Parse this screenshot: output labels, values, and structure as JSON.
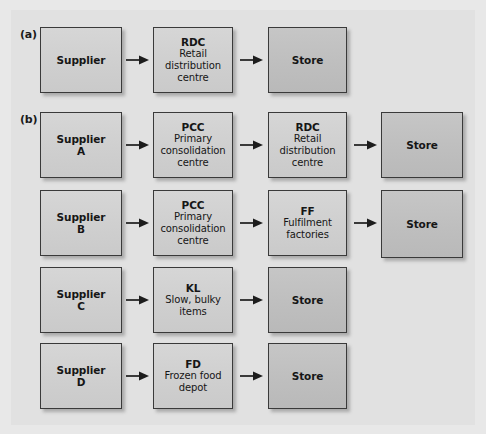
{
  "figure": {
    "background_color": "#e1e1e1",
    "frame_color": "#e8e8e8",
    "box_light_color": "#d2d2d2",
    "box_dark_color": "#c2c2c2",
    "border_color": "#3a3a3a",
    "text_color": "#161616"
  },
  "sections": {
    "a": {
      "label": "(a)"
    },
    "b": {
      "label": "(b)"
    }
  },
  "nodes": {
    "a_supplier": {
      "code": "Supplier",
      "desc": ""
    },
    "a_rdc": {
      "code": "RDC",
      "desc": "Retail distribution centre"
    },
    "a_store": {
      "code": "Store",
      "desc": ""
    },
    "b1_supplier": {
      "code": "Supplier",
      "desc": "A"
    },
    "b1_pcc": {
      "code": "PCC",
      "desc": "Primary consolidation centre"
    },
    "b1_rdc": {
      "code": "RDC",
      "desc": "Retail distribution centre"
    },
    "b1_store": {
      "code": "Store",
      "desc": ""
    },
    "b2_supplier": {
      "code": "Supplier",
      "desc": "B"
    },
    "b2_pcc": {
      "code": "PCC",
      "desc": "Primary consolidation centre"
    },
    "b2_ff": {
      "code": "FF",
      "desc": "Fulfilment factories"
    },
    "b2_store": {
      "code": "Store",
      "desc": ""
    },
    "b3_supplier": {
      "code": "Supplier",
      "desc": "C"
    },
    "b3_kl": {
      "code": "KL",
      "desc": "Slow, bulky items"
    },
    "b3_store": {
      "code": "Store",
      "desc": ""
    },
    "b4_supplier": {
      "code": "Supplier",
      "desc": "D"
    },
    "b4_fd": {
      "code": "FD",
      "desc": "Frozen food depot"
    },
    "b4_store": {
      "code": "Store",
      "desc": ""
    }
  },
  "flows": [
    {
      "from": "a_supplier",
      "to": "a_rdc"
    },
    {
      "from": "a_rdc",
      "to": "a_store"
    },
    {
      "from": "b1_supplier",
      "to": "b1_pcc"
    },
    {
      "from": "b1_pcc",
      "to": "b1_rdc"
    },
    {
      "from": "b1_rdc",
      "to": "b1_store"
    },
    {
      "from": "b2_supplier",
      "to": "b2_pcc"
    },
    {
      "from": "b2_pcc",
      "to": "b2_ff"
    },
    {
      "from": "b2_ff",
      "to": "b2_store"
    },
    {
      "from": "b3_supplier",
      "to": "b3_kl"
    },
    {
      "from": "b3_kl",
      "to": "b3_store"
    },
    {
      "from": "b4_supplier",
      "to": "b4_fd"
    },
    {
      "from": "b4_fd",
      "to": "b4_store"
    }
  ]
}
